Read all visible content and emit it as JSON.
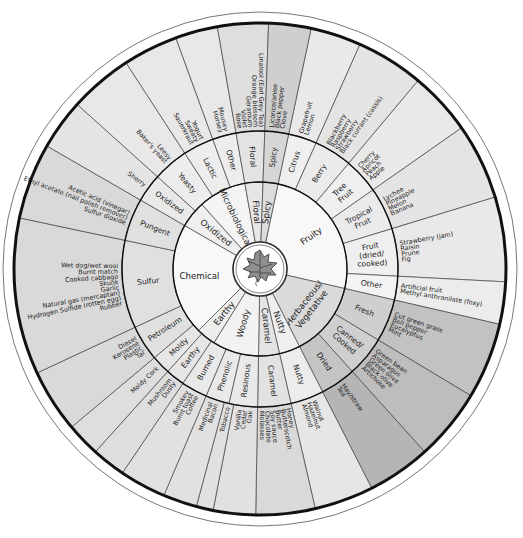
{
  "geometry": {
    "cx": 260,
    "cy": 269,
    "r_center": 27,
    "r_inner": 87,
    "r_mid": 138,
    "r_outer": 246,
    "r_rim": 257
  },
  "colors": {
    "inner_light": "#f7f7f7",
    "mid_light": "#ededed",
    "outer_light": "#e2e2e2",
    "shade_1": "#dcdcdc",
    "shade_2": "#c9c9c9",
    "shade_3": "#b9b9b9",
    "line": "#333333",
    "rim": "#111111",
    "leaf": "#8f8f8f"
  },
  "center": {
    "icon": "grape-leaf-icon"
  },
  "inner_ring": [
    {
      "label": "Fruity",
      "start": 12,
      "end": 103,
      "fill": "#f8f8f8"
    },
    {
      "label": "Herbaceous/ Vegetative",
      "start": 103,
      "end": 153,
      "fill": "#dadada"
    },
    {
      "label": "Nutty",
      "start": 153,
      "end": 167,
      "fill": "#efefef"
    },
    {
      "label": "Caramel",
      "start": 167,
      "end": 181,
      "fill": "#e4e4e4"
    },
    {
      "label": "Woody",
      "start": 181,
      "end": 212,
      "fill": "#f2f2f2"
    },
    {
      "label": "Earthy",
      "start": 212,
      "end": 225,
      "fill": "#eeeeee"
    },
    {
      "label": "Chemical",
      "start": 225,
      "end": 300,
      "fill": "#f8f8f8"
    },
    {
      "label": "Oxidized",
      "start": 300,
      "end": 318,
      "fill": "#efefef"
    },
    {
      "label": "Microbiological",
      "start": 318,
      "end": 350,
      "fill": "#f4f4f4"
    },
    {
      "label": "Floral",
      "start": 350,
      "end": 362,
      "fill": "#e6e6e6"
    },
    {
      "label": "Spicy",
      "start": 362,
      "end": 372,
      "fill": "#dcdcdc"
    }
  ],
  "middle_ring": [
    {
      "label": "Citrus",
      "start": 12,
      "end": 24,
      "fill": "#efefef"
    },
    {
      "label": "Berry",
      "start": 24,
      "end": 40,
      "fill": "#ebebeb"
    },
    {
      "label": "Tree Fruit",
      "start": 40,
      "end": 55,
      "fill": "#efefef"
    },
    {
      "label": "Tropical Fruit",
      "start": 55,
      "end": 73,
      "fill": "#ebebeb"
    },
    {
      "label": "Fruit (dried/ cooked)",
      "start": 73,
      "end": 93,
      "fill": "#efefef"
    },
    {
      "label": "Other",
      "start": 93,
      "end": 103,
      "fill": "#f3f3f3"
    },
    {
      "label": "Fresh",
      "start": 103,
      "end": 121,
      "fill": "#cfcfcf"
    },
    {
      "label": "Canned/ Cooked",
      "start": 121,
      "end": 138,
      "fill": "#cfcfcf"
    },
    {
      "label": "Dried",
      "start": 138,
      "end": 153,
      "fill": "#c4c4c4"
    },
    {
      "label": "Nutty",
      "start": 153,
      "end": 167,
      "fill": "#ececec"
    },
    {
      "label": "Caramel",
      "start": 167,
      "end": 181,
      "fill": "#e2e2e2"
    },
    {
      "label": "Resinous",
      "start": 181,
      "end": 193,
      "fill": "#e9e9e9"
    },
    {
      "label": "Phenolic",
      "start": 193,
      "end": 203,
      "fill": "#e9e9e9"
    },
    {
      "label": "Burned",
      "start": 203,
      "end": 214,
      "fill": "#e9e9e9"
    },
    {
      "label": "Earthy",
      "start": 214,
      "end": 222,
      "fill": "#e6e6e6"
    },
    {
      "label": "Moldy",
      "start": 222,
      "end": 230,
      "fill": "#e6e6e6"
    },
    {
      "label": "Petroleum",
      "start": 230,
      "end": 245,
      "fill": "#e0e0e0"
    },
    {
      "label": "Sulfur",
      "start": 245,
      "end": 282,
      "fill": "#e0e0e0"
    },
    {
      "label": "Pungent",
      "start": 282,
      "end": 300,
      "fill": "#e0e0e0"
    },
    {
      "label": "Oxidized",
      "start": 300,
      "end": 312,
      "fill": "#e9e9e9"
    },
    {
      "label": "Yeasty",
      "start": 312,
      "end": 327,
      "fill": "#ededed"
    },
    {
      "label": "Lactic",
      "start": 327,
      "end": 340,
      "fill": "#ededed"
    },
    {
      "label": "Other",
      "start": 340,
      "end": 350,
      "fill": "#ededed"
    },
    {
      "label": "Floral",
      "start": 350,
      "end": 362,
      "fill": "#e3e3e3"
    },
    {
      "label": "Spicy",
      "start": 362,
      "end": 372,
      "fill": "#d6d6d6"
    }
  ],
  "outer_ring": [
    {
      "items": [
        "Grapefruit",
        "Lemon"
      ],
      "start": 12,
      "end": 24,
      "fill": "#e9e9e9"
    },
    {
      "items": [
        "Blackberry",
        "Raspberry",
        "Strawberry",
        "Black currant (cassis)"
      ],
      "start": 24,
      "end": 40,
      "fill": "#e4e4e4"
    },
    {
      "items": [
        "Cherry",
        "Apricot",
        "Peach",
        "Apple"
      ],
      "start": 40,
      "end": 55,
      "fill": "#e9e9e9"
    },
    {
      "items": [
        "Lychee",
        "Pineapple",
        "Melon",
        "Banana"
      ],
      "start": 55,
      "end": 73,
      "fill": "#e4e4e4"
    },
    {
      "items": [
        "Strawberry (jam)",
        "Raisin",
        "Prune",
        "Fig"
      ],
      "start": 73,
      "end": 93,
      "fill": "#e9e9e9"
    },
    {
      "items": [
        "Artificial fruit",
        "Methyl anthranilate (foxy)"
      ],
      "start": 93,
      "end": 103,
      "fill": "#ececec"
    },
    {
      "items": [
        "Cut green grass",
        "Bell pepper",
        "Eucalyptus",
        "Mint"
      ],
      "start": 103,
      "end": 121,
      "fill": "#c2c2c2"
    },
    {
      "items": [
        "Green bean",
        "Asparagus",
        "Green olive",
        "Black olive",
        "Artichoke"
      ],
      "start": 121,
      "end": 138,
      "fill": "#bdbdbd"
    },
    {
      "items": [
        "Hay/straw",
        "Tea"
      ],
      "start": 138,
      "end": 153,
      "fill": "#b5b5b5"
    },
    {
      "items": [
        "Walnut",
        "Hazelnut",
        "Almond"
      ],
      "start": 153,
      "end": 167,
      "fill": "#e6e6e6"
    },
    {
      "items": [
        "Honey",
        "Butterscotch",
        "Butter",
        "Soy sauce",
        "Chocolate",
        "Molasses"
      ],
      "start": 167,
      "end": 181,
      "fill": "#d9d9d9"
    },
    {
      "items": [
        "Vanilla",
        "Cedar",
        "Oak"
      ],
      "start": 181,
      "end": 191,
      "fill": "#e1e1e1"
    },
    {
      "items": [
        "Tobacco"
      ],
      "start": 191,
      "end": 195,
      "fill": "#e1e1e1"
    },
    {
      "items": [
        "Medicinal",
        "Bacon"
      ],
      "start": 195,
      "end": 203,
      "fill": "#e1e1e1"
    },
    {
      "items": [
        "Smokey",
        "Burnt toast",
        "Coffee"
      ],
      "start": 203,
      "end": 214,
      "fill": "#e1e1e1"
    },
    {
      "items": [
        "Mushroom",
        "Dusty"
      ],
      "start": 214,
      "end": 222,
      "fill": "#dedede"
    },
    {
      "items": [
        "Moldy Cork"
      ],
      "start": 222,
      "end": 230,
      "fill": "#dedede"
    },
    {
      "items": [
        "Diesel",
        "Kerosene",
        "Plastic",
        "Tar"
      ],
      "start": 230,
      "end": 245,
      "fill": "#d9d9d9"
    },
    {
      "items": [
        "Wet dog/wet wool",
        "Burnt match",
        "Cooked cabbage",
        "Skunk",
        "Garlic",
        "Natural gas (mercaptan)",
        "Hydrogen Sulfide (rotten egg)",
        "Rubber"
      ],
      "start": 245,
      "end": 282,
      "fill": "#d9d9d9"
    },
    {
      "items": [
        "Acetic acid (vinegar)",
        "Ethyl acetate (nail polish remover)",
        "Sulfur dioxide"
      ],
      "start": 282,
      "end": 300,
      "fill": "#d9d9d9"
    },
    {
      "items": [
        "Sherry"
      ],
      "start": 300,
      "end": 312,
      "fill": "#e4e4e4"
    },
    {
      "items": [
        "Leesy",
        "Baker's yeast"
      ],
      "start": 312,
      "end": 327,
      "fill": "#e8e8e8"
    },
    {
      "items": [
        "Yogurt",
        "Sweaty",
        "Sauerkraut"
      ],
      "start": 327,
      "end": 340,
      "fill": "#e8e8e8"
    },
    {
      "items": [
        "Mousey",
        "Horsey"
      ],
      "start": 340,
      "end": 350,
      "fill": "#e8e8e8"
    },
    {
      "items": [
        "Linalool (Earl Grey Tea)",
        "Orange blossom",
        "Geranium",
        "Violet",
        "Rose"
      ],
      "start": 350,
      "end": 362,
      "fill": "#dedede"
    },
    {
      "items": [
        "Licorice/anise",
        "Black pepper",
        "Clove"
      ],
      "start": 362,
      "end": 372,
      "fill": "#cfcfcf"
    }
  ]
}
